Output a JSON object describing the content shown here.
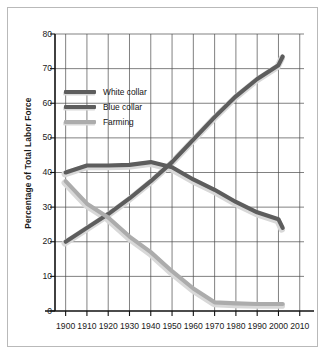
{
  "chart_data": {
    "type": "line",
    "title": "",
    "xlabel": "",
    "ylabel": "Percentage of Total Labor Force",
    "xlim": [
      1895,
      2012
    ],
    "ylim": [
      0,
      80
    ],
    "grid": true,
    "legend_position": "inside-upper-left",
    "x_ticks": [
      1900,
      1910,
      1920,
      1930,
      1940,
      1950,
      1960,
      1970,
      1980,
      1990,
      2000,
      2010
    ],
    "y_ticks": [
      0,
      10,
      20,
      30,
      40,
      50,
      60,
      70,
      80
    ],
    "series": [
      {
        "name": "White collar",
        "color": "#5d5d5d",
        "x": [
          1900,
          1910,
          1920,
          1930,
          1940,
          1950,
          1960,
          1970,
          1980,
          1990,
          2000,
          2002
        ],
        "values": [
          20,
          24,
          28,
          32.5,
          37.5,
          43,
          49.5,
          56,
          62,
          67,
          71,
          73.5
        ]
      },
      {
        "name": "Blue collar",
        "color": "#5d5d5d",
        "x": [
          1900,
          1910,
          1920,
          1930,
          1940,
          1950,
          1960,
          1970,
          1980,
          1990,
          2000,
          2002
        ],
        "values": [
          40,
          42,
          42,
          42.2,
          43,
          41.5,
          38,
          35,
          31.5,
          28.5,
          26.5,
          24
        ]
      },
      {
        "name": "Farming",
        "color": "#acacac",
        "x": [
          1900,
          1910,
          1920,
          1930,
          1940,
          1950,
          1960,
          1970,
          1980,
          1990,
          2000,
          2002
        ],
        "values": [
          37.5,
          31,
          27,
          21.5,
          17,
          11.5,
          6.5,
          2.5,
          2.2,
          2,
          2,
          2
        ]
      }
    ]
  },
  "axes": {
    "y_title": "Percentage of Total Labor Force",
    "y_labels": [
      "80",
      "70",
      "60",
      "50",
      "40",
      "30",
      "20",
      "10",
      "0"
    ],
    "x_labels": [
      "1900",
      "1910",
      "1920",
      "1930",
      "1940",
      "1950",
      "1960",
      "1970",
      "1980",
      "1990",
      "2000",
      "2010"
    ]
  },
  "legend": {
    "entries": [
      {
        "label": "White collar",
        "color": "#5d5d5d"
      },
      {
        "label": "Blue collar",
        "color": "#5d5d5d"
      },
      {
        "label": "Farming",
        "color": "#acacac"
      }
    ]
  },
  "style": {
    "frame_color": "#b9b9b9",
    "grid_color": "#4a4a4a",
    "axis_color": "#111111",
    "background": "#ffffff",
    "shadow_color": "#d8d8d8"
  }
}
